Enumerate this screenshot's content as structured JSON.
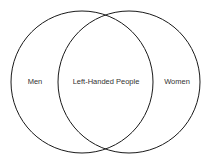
{
  "diagram": {
    "type": "venn",
    "sets": [
      {
        "label": "Men",
        "cx": 82,
        "cy": 82,
        "r": 71
      },
      {
        "label": "Women",
        "cx": 129,
        "cy": 82,
        "r": 71
      }
    ],
    "intersection_label": "Left-Handed People",
    "stroke_color": "#1a1a1a"
  }
}
